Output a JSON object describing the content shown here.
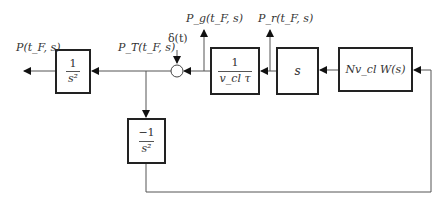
{
  "diagram": {
    "type": "block-diagram",
    "signals": {
      "output": "P(t_F, s)",
      "total": "P_T(t_F, s)",
      "impulse": "δ(t)",
      "pg": "P_g(t_F, s)",
      "pr": "P_r(t_F, s)"
    },
    "blocks": {
      "integrator_out": {
        "numerator": "1",
        "denominator": "s²"
      },
      "neg_integrator": {
        "numerator": "−1",
        "denominator": "s²"
      },
      "inverse_vcl_tau": {
        "numerator": "1",
        "denominator": "v_cl τ"
      },
      "differentiator": {
        "label": "s"
      },
      "source": {
        "label": "Nv_cl W(s)"
      }
    },
    "colors": {
      "line": "#555555",
      "block_border": "#222222",
      "text": "#333333"
    }
  }
}
